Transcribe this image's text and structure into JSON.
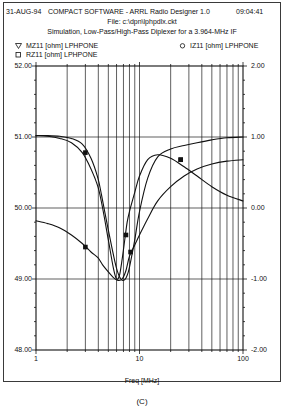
{
  "header": {
    "date": "31-AUG-94",
    "app_title": "COMPACT SOFTWARE - ARRL Radio Designer 1.0",
    "time": "09:04:41",
    "file_line": "File: c:\\dpn\\lphpdlx.ckt",
    "simulation_line": "Simulation, Low-Pass/High-Pass Diplexer for a 3.964-MHz IF"
  },
  "legend": {
    "items": [
      {
        "label": "MZ11 [ohm] LPHPONE",
        "marker": "triangle-down-marker",
        "axis": "left"
      },
      {
        "label": "RZ11 [ohm] LPHPONE",
        "marker": "square-marker",
        "axis": "left"
      },
      {
        "label": "IZ11 [ohm] LPHPONE",
        "marker": "circle-marker",
        "axis": "right"
      }
    ]
  },
  "figure_caption": "(C)",
  "chart_data": {
    "type": "line",
    "title": "Simulation, Low-Pass/High-Pass Diplexer for a 3.964-MHz IF",
    "xlabel": "Freq [MHz]",
    "xscale": "log",
    "xlim": [
      1,
      100
    ],
    "xticks": [
      1,
      10,
      100
    ],
    "xticklabels": [
      "1",
      "10",
      "100"
    ],
    "grid": true,
    "grid_style": "vertical log minor lines + horizontal major lines",
    "legend_position": "above-plot",
    "y_left": {
      "label": "",
      "ylim": [
        48.0,
        52.0
      ],
      "ticks": [
        48.0,
        49.0,
        50.0,
        51.0,
        52.0
      ],
      "ticklabels": [
        "48.00",
        "49.00",
        "50.00",
        "51.00",
        "52.00"
      ],
      "unit": "ohm"
    },
    "y_right": {
      "label": "",
      "ylim": [
        -2.0,
        2.0
      ],
      "ticks": [
        -2.0,
        -1.0,
        0.0,
        1.0,
        2.0
      ],
      "ticklabels": [
        "-2.00",
        "-1.00",
        "0.00",
        "1.00",
        "2.00"
      ],
      "unit": "ohm"
    },
    "series": [
      {
        "name": "MZ11 [ohm] LPHPONE",
        "axis": "left",
        "marker": "square-marker",
        "x": [
          1.0,
          1.3,
          1.7,
          2.2,
          2.8,
          3.4,
          3.964,
          4.3,
          4.8,
          5.4,
          6.0,
          6.6,
          7.2,
          7.8,
          8.4,
          9.0,
          10.0,
          12.0,
          15.0,
          20.0,
          27.0,
          36.0,
          50.0,
          70.0,
          100.0
        ],
        "y": [
          51.02,
          51.02,
          51.01,
          50.98,
          50.9,
          50.7,
          50.42,
          50.18,
          49.82,
          49.45,
          49.15,
          49.0,
          48.99,
          49.1,
          49.32,
          49.55,
          49.95,
          50.42,
          50.72,
          50.83,
          50.88,
          50.92,
          50.96,
          50.99,
          51.0
        ],
        "markers_at": [
          {
            "x": 3.0,
            "y": 50.78
          },
          {
            "x": 25.0,
            "y": 50.68
          }
        ]
      },
      {
        "name": "RZ11 [ohm] LPHPONE",
        "axis": "left",
        "marker": "square-marker",
        "x": [
          1.0,
          1.3,
          1.7,
          2.2,
          2.8,
          3.4,
          3.964,
          4.4,
          5.0,
          5.6,
          6.2,
          6.8,
          7.4,
          8.0,
          9.0,
          10.0,
          12.0,
          15.0,
          20.0,
          27.0,
          36.0,
          50.0,
          70.0,
          100.0
        ],
        "y": [
          49.82,
          49.78,
          49.72,
          49.62,
          49.5,
          49.38,
          49.3,
          49.2,
          49.1,
          49.02,
          48.98,
          49.0,
          49.12,
          49.32,
          49.48,
          49.62,
          49.85,
          50.1,
          50.3,
          50.45,
          50.55,
          50.62,
          50.66,
          50.68
        ],
        "markers_at": [
          {
            "x": 3.0,
            "y": 49.45
          },
          {
            "x": 8.2,
            "y": 49.38
          },
          {
            "x": 25.0,
            "y": 50.68
          }
        ]
      },
      {
        "name": "IZ11 [ohm] LPHPONE",
        "axis": "right",
        "marker": "circle-marker",
        "x": [
          1.0,
          1.3,
          1.7,
          2.2,
          2.8,
          3.4,
          3.964,
          4.4,
          5.0,
          5.6,
          6.0,
          6.4,
          6.8,
          7.2,
          7.6,
          8.0,
          9.0,
          10.0,
          12.0,
          15.0,
          20.0,
          27.0,
          36.0,
          50.0,
          70.0,
          100.0
        ],
        "y": [
          1.02,
          1.01,
          0.98,
          0.92,
          0.78,
          0.55,
          0.3,
          0.0,
          -0.45,
          -0.85,
          -1.0,
          -0.95,
          -0.72,
          -0.45,
          -0.2,
          -0.05,
          0.22,
          0.45,
          0.68,
          0.75,
          0.7,
          0.58,
          0.45,
          0.3,
          0.18,
          0.1
        ],
        "markers_at": [
          {
            "x": 7.4,
            "y": -0.38
          }
        ]
      }
    ]
  }
}
